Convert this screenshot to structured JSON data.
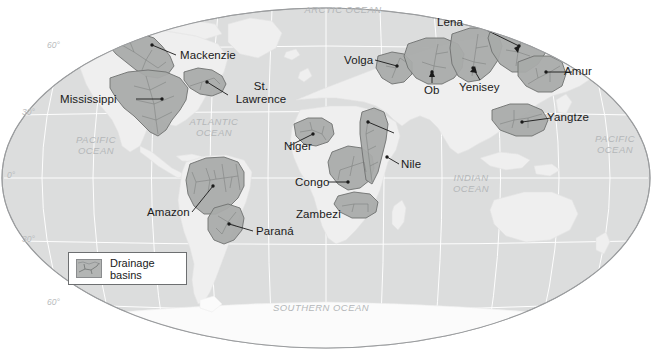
{
  "figure": {
    "type": "thematic-world-map",
    "projection": "elliptical (Robinson-like) world projection"
  },
  "colors": {
    "background": "#ffffff",
    "ocean": "#dcdddd",
    "land": "#efefef",
    "basin_fill": "#a9abaa",
    "basin_outline": "#6f7271",
    "river_line": "#7c7f7e",
    "graticule": "#ffffff",
    "globe_outline": "#9a9c9e",
    "label_text": "#1a1a1a",
    "ocean_label_text": "#b4b7b9",
    "legend_border": "#6d6f71"
  },
  "legend": {
    "label": "Drainage basins",
    "swatch_name": "drainage-basin-swatch"
  },
  "graticule": {
    "latitude_labels": [
      "60°",
      "30°",
      "0°",
      "30°",
      "60°"
    ],
    "longitude_interval_degrees": 30,
    "latitude_interval_degrees": 30
  },
  "ocean_labels": [
    {
      "name": "arctic-ocean",
      "text": "ARCTIC OCEAN"
    },
    {
      "name": "pacific-ocean-west",
      "text": "PACIFIC\nOCEAN"
    },
    {
      "name": "atlantic-ocean",
      "text": "ATLANTIC\nOCEAN"
    },
    {
      "name": "indian-ocean",
      "text": "INDIAN\nOCEAN"
    },
    {
      "name": "pacific-ocean-east",
      "text": "PACIFIC\nOCEAN"
    },
    {
      "name": "southern-ocean",
      "text": "SOUTHERN OCEAN"
    }
  ],
  "basins": [
    {
      "name": "mackenzie",
      "label": "Mackenzie",
      "continent": "North America"
    },
    {
      "name": "mississippi",
      "label": "Mississippi",
      "continent": "North America"
    },
    {
      "name": "st-lawrence",
      "label": "St.\nLawrence",
      "continent": "North America"
    },
    {
      "name": "amazon",
      "label": "Amazon",
      "continent": "South America"
    },
    {
      "name": "parana",
      "label": "Paraná",
      "continent": "South America"
    },
    {
      "name": "niger",
      "label": "Niger",
      "continent": "Africa"
    },
    {
      "name": "congo",
      "label": "Congo",
      "continent": "Africa"
    },
    {
      "name": "nile",
      "label": "Nile",
      "continent": "Africa"
    },
    {
      "name": "zambezi",
      "label": "Zambezi",
      "continent": "Africa"
    },
    {
      "name": "volga",
      "label": "Volga",
      "continent": "Eurasia"
    },
    {
      "name": "ob",
      "label": "Ob",
      "continent": "Eurasia"
    },
    {
      "name": "yenisey",
      "label": "Yenisey",
      "continent": "Eurasia"
    },
    {
      "name": "lena",
      "label": "Lena",
      "continent": "Eurasia"
    },
    {
      "name": "amur",
      "label": "Amur",
      "continent": "Eurasia"
    },
    {
      "name": "yangtze",
      "label": "Yangtze",
      "continent": "Eurasia"
    }
  ]
}
